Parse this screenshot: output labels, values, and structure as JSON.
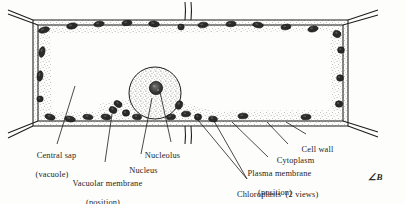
{
  "diagram": {
    "title": "",
    "style": "hand-drawn ink line drawing with stipple shading",
    "background_color": "#fdfdfb",
    "ink_color": "#1d1d1d",
    "stipple_color": "#5a5a5a",
    "organelle_fill": "#2b2b2b"
  },
  "labels": [
    {
      "id": "central-sap",
      "line1": "Central sap",
      "line2": "(vacuole)",
      "x": 26,
      "y": 146,
      "align": "center"
    },
    {
      "id": "vacuolar-membrane",
      "line1": "Vacuolar membrane",
      "line2": "(position)",
      "x": 103,
      "y": 174,
      "align": "center"
    },
    {
      "id": "nucleus",
      "line1": "Nucleus",
      "line2": "",
      "x": 138,
      "y": 161,
      "align": "center"
    },
    {
      "id": "nucleolus",
      "line1": "Nucleolus",
      "line2": "",
      "x": 156,
      "y": 146,
      "align": "center"
    },
    {
      "id": "chloroplasts",
      "line1": "Chloroplasts  (2 views)",
      "line2": "",
      "x": 228,
      "y": 183,
      "align": "left"
    },
    {
      "id": "plasma-membrane",
      "line1": "Plasma membrane",
      "line2": "(position)",
      "x": 275,
      "y": 164,
      "align": "center"
    },
    {
      "id": "cytoplasm",
      "line1": "Cytoplasm",
      "line2": "",
      "x": 291,
      "y": 150,
      "align": "center"
    },
    {
      "id": "cell-wall",
      "line1": "Cell wall",
      "line2": "",
      "x": 311,
      "y": 139,
      "align": "center"
    }
  ],
  "signature": {
    "text": "∠B",
    "x": 370,
    "y": 176
  },
  "structures": {
    "cell_wall": "double outline rectangle with adjacent wall stubs at corners and mid edges",
    "cytoplasm": "stippled band lining the inside of the cell wall",
    "vacuole": "large blank central region",
    "nucleus": "stippled circle on lower middle of cell",
    "nucleolus": "small dark mottled circle inside nucleus",
    "chloroplasts_face_view": "round dark ovals",
    "chloroplasts_edge_view": "narrow elongated dark ovals"
  },
  "chloroplasts": [
    {
      "cx": 44,
      "cy": 30,
      "rx": 5.6,
      "ry": 2.9,
      "rot": -14
    },
    {
      "cx": 72,
      "cy": 26,
      "rx": 5.4,
      "ry": 3.0,
      "rot": -10
    },
    {
      "cx": 99,
      "cy": 24,
      "rx": 5.2,
      "ry": 2.8,
      "rot": -8
    },
    {
      "cx": 127,
      "cy": 23,
      "rx": 5.0,
      "ry": 2.6,
      "rot": -5
    },
    {
      "cx": 154,
      "cy": 24,
      "rx": 5.4,
      "ry": 2.9,
      "rot": 6
    },
    {
      "cx": 181,
      "cy": 27,
      "rx": 3.2,
      "ry": 3.0,
      "rot": 0
    },
    {
      "cx": 203,
      "cy": 25,
      "rx": 5.2,
      "ry": 2.8,
      "rot": -6
    },
    {
      "cx": 231,
      "cy": 24,
      "rx": 5.0,
      "ry": 2.7,
      "rot": -4
    },
    {
      "cx": 258,
      "cy": 25,
      "rx": 5.4,
      "ry": 2.8,
      "rot": 8
    },
    {
      "cx": 286,
      "cy": 27,
      "rx": 5.0,
      "ry": 2.7,
      "rot": -9
    },
    {
      "cx": 313,
      "cy": 29,
      "rx": 5.2,
      "ry": 2.9,
      "rot": -12
    },
    {
      "cx": 337,
      "cy": 34,
      "rx": 4.0,
      "ry": 3.4,
      "rot": 20
    },
    {
      "cx": 341,
      "cy": 50,
      "rx": 3.4,
      "ry": 3.2,
      "rot": 0
    },
    {
      "cx": 340,
      "cy": 78,
      "rx": 3.4,
      "ry": 3.2,
      "rot": 0
    },
    {
      "cx": 339,
      "cy": 104,
      "rx": 3.6,
      "ry": 3.2,
      "rot": 0
    },
    {
      "cx": 42,
      "cy": 52,
      "rx": 2.9,
      "ry": 5.4,
      "rot": 12
    },
    {
      "cx": 40,
      "cy": 76,
      "rx": 2.9,
      "ry": 5.2,
      "rot": 8
    },
    {
      "cx": 40,
      "cy": 99,
      "rx": 3.2,
      "ry": 3.0,
      "rot": 0
    },
    {
      "cx": 50,
      "cy": 117,
      "rx": 5.2,
      "ry": 2.9,
      "rot": 14
    },
    {
      "cx": 70,
      "cy": 119,
      "rx": 5.4,
      "ry": 2.8,
      "rot": 10
    },
    {
      "cx": 88,
      "cy": 117,
      "rx": 5.0,
      "ry": 2.6,
      "rot": 6
    },
    {
      "cx": 106,
      "cy": 117,
      "rx": 4.8,
      "ry": 2.8,
      "rot": 8
    },
    {
      "cx": 113,
      "cy": 110,
      "rx": 4.0,
      "ry": 3.2,
      "rot": 22
    },
    {
      "cx": 118,
      "cy": 104,
      "rx": 4.2,
      "ry": 3.0,
      "rot": 28
    },
    {
      "cx": 126,
      "cy": 113,
      "rx": 3.6,
      "ry": 3.2,
      "rot": 0
    },
    {
      "cx": 137,
      "cy": 117,
      "rx": 4.6,
      "ry": 2.8,
      "rot": 5
    },
    {
      "cx": 171,
      "cy": 117,
      "rx": 4.6,
      "ry": 2.8,
      "rot": -6
    },
    {
      "cx": 179,
      "cy": 105,
      "rx": 3.4,
      "ry": 4.4,
      "rot": 24
    },
    {
      "cx": 186,
      "cy": 114,
      "rx": 4.6,
      "ry": 2.8,
      "rot": -4
    },
    {
      "cx": 198,
      "cy": 117,
      "rx": 3.6,
      "ry": 3.2,
      "rot": 0
    },
    {
      "cx": 213,
      "cy": 119,
      "rx": 4.4,
      "ry": 2.8,
      "rot": 6
    },
    {
      "cx": 243,
      "cy": 116,
      "rx": 5.0,
      "ry": 2.8,
      "rot": -3
    },
    {
      "cx": 306,
      "cy": 117,
      "rx": 5.0,
      "ry": 2.8,
      "rot": -3
    }
  ]
}
